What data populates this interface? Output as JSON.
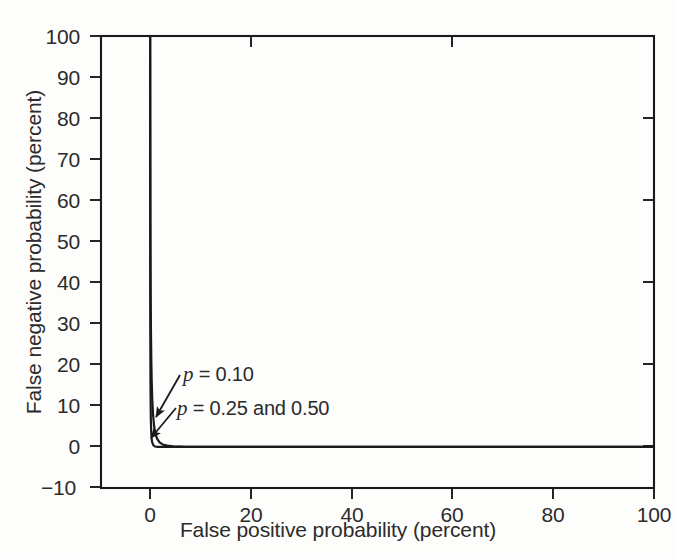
{
  "chart_data": {
    "type": "line",
    "title": "",
    "subtitle": "",
    "xlabel": "False positive probability (percent)",
    "ylabel": "False negative probability (percent)",
    "xlim": [
      0,
      100
    ],
    "ylim": [
      -10,
      100
    ],
    "xticks": [
      0,
      20,
      40,
      60,
      80,
      100
    ],
    "yticks": [
      -10,
      0,
      10,
      20,
      30,
      40,
      50,
      60,
      70,
      80,
      90,
      100
    ],
    "xtick_labels": [
      "0",
      "20",
      "40",
      "60",
      "80",
      "100"
    ],
    "ytick_labels": [
      "-10",
      "0",
      "10",
      "20",
      "30",
      "40",
      "50",
      "60",
      "70",
      "80",
      "90",
      "100"
    ],
    "grid": false,
    "legend_position": "none",
    "line_color": "#1a1a1a",
    "background_color": "#fdfdfc",
    "axis_color": "#1a1a1a",
    "series": [
      {
        "name": "p = 0.10",
        "annotation": "p = 0.10",
        "points": [
          [
            0.04,
            100.0
          ],
          [
            0.05,
            92.0
          ],
          [
            0.06,
            80.0
          ],
          [
            0.07,
            70.0
          ],
          [
            0.08,
            60.0
          ],
          [
            0.1,
            50.0
          ],
          [
            0.12,
            42.0
          ],
          [
            0.15,
            34.0
          ],
          [
            0.2,
            27.0
          ],
          [
            0.26,
            21.0
          ],
          [
            0.34,
            16.0
          ],
          [
            0.45,
            11.5
          ],
          [
            0.6,
            8.0
          ],
          [
            0.8,
            5.2
          ],
          [
            1.05,
            3.3
          ],
          [
            1.4,
            2.0
          ],
          [
            1.9,
            1.1
          ],
          [
            2.5,
            0.6
          ],
          [
            3.4,
            0.3
          ],
          [
            4.6,
            0.15
          ],
          [
            6.5,
            0.07
          ],
          [
            10.0,
            0.03
          ],
          [
            20.0,
            0.01
          ],
          [
            40.0,
            0.0
          ],
          [
            70.0,
            0.0
          ],
          [
            100.0,
            0.0
          ]
        ]
      },
      {
        "name": "p = 0.25 and 0.50",
        "annotation": "p = 0.25 and 0.50",
        "points": [
          [
            0.02,
            100.0
          ],
          [
            0.02,
            90.0
          ],
          [
            0.025,
            78.0
          ],
          [
            0.03,
            66.0
          ],
          [
            0.035,
            55.0
          ],
          [
            0.04,
            45.0
          ],
          [
            0.05,
            36.0
          ],
          [
            0.06,
            28.0
          ],
          [
            0.08,
            21.0
          ],
          [
            0.1,
            15.0
          ],
          [
            0.13,
            10.0
          ],
          [
            0.17,
            6.5
          ],
          [
            0.23,
            4.0
          ],
          [
            0.3,
            2.4
          ],
          [
            0.4,
            1.3
          ],
          [
            0.55,
            0.7
          ],
          [
            0.75,
            0.3
          ],
          [
            1.0,
            0.1
          ],
          [
            1.5,
            0.03
          ],
          [
            2.5,
            0.0
          ],
          [
            6.0,
            0.0
          ],
          [
            20.0,
            0.0
          ],
          [
            60.0,
            0.0
          ],
          [
            100.0,
            0.0
          ]
        ]
      }
    ],
    "annotations": [
      {
        "id": "p010",
        "text_prefix": "p",
        "text_rest": " = 0.10",
        "full_text": "p = 0.10",
        "arrow_from": [
          180,
          375
        ],
        "arrow_to": [
          156,
          417
        ]
      },
      {
        "id": "p025",
        "text_prefix": "p",
        "text_rest": " = 0.25 and 0.50",
        "full_text": "p = 0.25 and 0.50",
        "arrow_from": [
          176,
          408
        ],
        "arrow_to": [
          151,
          438
        ]
      }
    ]
  },
  "axes": {
    "x_title": "False positive probability (percent)",
    "y_title": "False negative probability (percent)",
    "x_tick_labels": [
      "0",
      "20",
      "40",
      "60",
      "80",
      "100"
    ],
    "y_tick_labels": [
      "100",
      "90",
      "80",
      "70",
      "60",
      "50",
      "40",
      "30",
      "20",
      "10",
      "0",
      "−10"
    ]
  }
}
